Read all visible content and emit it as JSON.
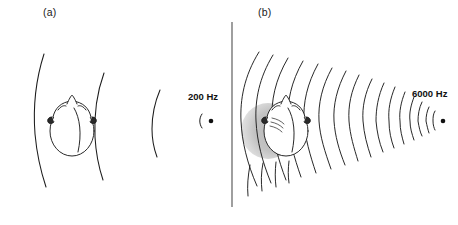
{
  "figure": {
    "width": 458,
    "height": 225,
    "background": "#ffffff",
    "stroke_color": "#1a1a1a",
    "shadow_color": "#bfbfbf",
    "divider_color": "#555555"
  },
  "panels": [
    {
      "id": "a",
      "label": "(a)",
      "frequency_label": "200 Hz",
      "frequency_hz": 200,
      "wavefront_count": 3,
      "has_acoustic_shadow": false,
      "note": "Long wavelength; wavefronts bend (diffract) around the head, no shadow."
    },
    {
      "id": "b",
      "label": "(b)",
      "frequency_label": "6000 Hz",
      "frequency_hz": 6000,
      "wavefront_count": 18,
      "has_acoustic_shadow": true,
      "note": "Short wavelength; an acoustic shadow forms on the far side of the head."
    }
  ],
  "labels": {
    "panel_a": "(a)",
    "panel_b": "(b)",
    "freq_low": "200 Hz",
    "freq_high": "6000 Hz"
  },
  "sources": {
    "low": {
      "x": 211,
      "y": 121,
      "radius": 2.3
    },
    "high": {
      "x": 443,
      "y": 121,
      "radius": 2.3
    }
  },
  "heads": {
    "panel_a": {
      "cx": 72,
      "cy": 127,
      "rx": 25,
      "ry": 30
    },
    "panel_b": {
      "cx": 285,
      "cy": 127,
      "rx": 25,
      "ry": 30
    }
  },
  "divider": {
    "x": 232,
    "y_top": 22,
    "y_bottom": 207
  }
}
